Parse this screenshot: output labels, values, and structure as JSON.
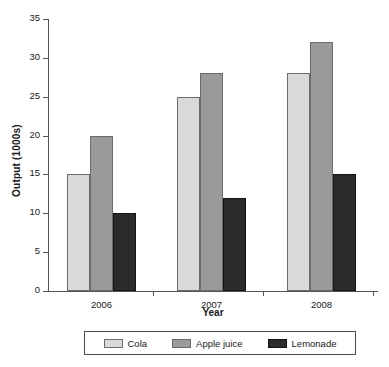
{
  "chart_data": {
    "type": "bar",
    "title": "",
    "subtitle": "",
    "xlabel": "Year",
    "ylabel": "Output (1000s)",
    "categories": [
      "2006",
      "2007",
      "2008"
    ],
    "series": [
      {
        "name": "Cola",
        "values": [
          15,
          25,
          28
        ],
        "color": "#d9d9d9"
      },
      {
        "name": "Apple juice",
        "values": [
          20,
          28,
          32
        ],
        "color": "#9a9a9a"
      },
      {
        "name": "Lemonade",
        "values": [
          10,
          12,
          15
        ],
        "color": "#2b2b2b"
      }
    ],
    "ylim": [
      0,
      35
    ],
    "ytick_values": [
      0,
      5,
      10,
      15,
      20,
      25,
      30,
      35
    ],
    "ytick_labels": [
      "0",
      "5",
      "10",
      "15",
      "20",
      "25",
      "30",
      "35"
    ],
    "grid": false,
    "legend_position": "bottom",
    "legend_entries": [
      "Cola",
      "Apple juice",
      "Lemonade"
    ],
    "annotations": []
  },
  "colors": {
    "axis": "#555555",
    "text": "#1a1a1a",
    "background": "#ffffff",
    "legend_border": "#4a4a4a"
  }
}
